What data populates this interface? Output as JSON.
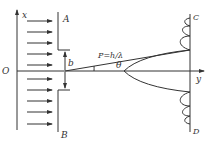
{
  "diagram": {
    "labels": {
      "x_axis": "x",
      "y_axis": "y",
      "origin": "O",
      "plate_top": "A",
      "plate_bottom": "B",
      "slit_width": "b",
      "momentum": "P=h/λ",
      "angle": "θ",
      "screen_top": "C",
      "screen_bottom": "D"
    },
    "incident_arrows": 10
  }
}
